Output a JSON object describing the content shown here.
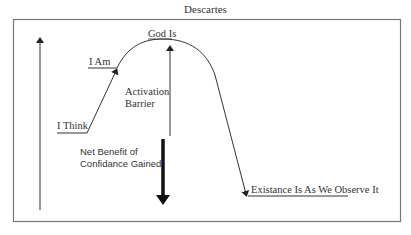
{
  "diagram": {
    "title": "Descartes",
    "labels": {
      "i_think": "I Think",
      "i_am": "I Am",
      "god_is": "God Is",
      "activation_barrier_line1": "Activation",
      "activation_barrier_line2": "Barrier",
      "net_benefit_line1": "Net Benefit of",
      "net_benefit_line2": "Confidance Gained",
      "existence": "Existance Is As We Observe It"
    },
    "colors": {
      "line": "#333333",
      "frame": "#777777",
      "background": "#ffffff"
    }
  }
}
